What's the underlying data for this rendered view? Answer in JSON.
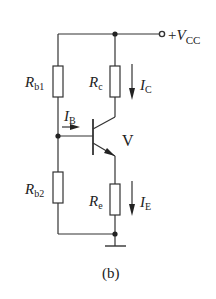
{
  "diagram": {
    "caption": "(b)",
    "supply": {
      "sign": "+",
      "symbol": "V",
      "subscript": "CC"
    },
    "transistor": {
      "label": "V"
    },
    "resistors": [
      {
        "id": "rb1",
        "symbol": "R",
        "subscript": "b1"
      },
      {
        "id": "rc",
        "symbol": "R",
        "subscript": "c"
      },
      {
        "id": "rb2",
        "symbol": "R",
        "subscript": "b2"
      },
      {
        "id": "re",
        "symbol": "R",
        "subscript": "e"
      }
    ],
    "currents": [
      {
        "id": "ib",
        "symbol": "I",
        "subscript": "B"
      },
      {
        "id": "ic",
        "symbol": "I",
        "subscript": "C"
      },
      {
        "id": "ie",
        "symbol": "I",
        "subscript": "E"
      }
    ],
    "colors": {
      "line": "#333333",
      "background": "#ffffff"
    }
  }
}
